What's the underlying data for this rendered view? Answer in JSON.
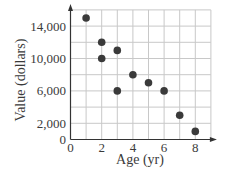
{
  "chart_data": {
    "type": "scatter",
    "title": "",
    "xlabel": "Age (yr)",
    "ylabel": "Value (dollars)",
    "x": [
      1,
      2,
      2,
      3,
      3,
      4,
      5,
      6,
      7,
      8
    ],
    "y": [
      15000,
      12000,
      10000,
      11000,
      6000,
      8000,
      7000,
      6000,
      3000,
      1000
    ],
    "points": [
      {
        "x": 1,
        "y": 15000
      },
      {
        "x": 2,
        "y": 12000
      },
      {
        "x": 2,
        "y": 10000
      },
      {
        "x": 3,
        "y": 11000
      },
      {
        "x": 3,
        "y": 6000
      },
      {
        "x": 4,
        "y": 8000
      },
      {
        "x": 5,
        "y": 7000
      },
      {
        "x": 6,
        "y": 6000
      },
      {
        "x": 7,
        "y": 3000
      },
      {
        "x": 8,
        "y": 1000
      }
    ],
    "xlim": [
      0,
      9
    ],
    "ylim": [
      0,
      16000
    ],
    "x_ticks": [
      0,
      2,
      4,
      6,
      8
    ],
    "x_tick_labels": [
      "0",
      "2",
      "4",
      "6",
      "8"
    ],
    "y_ticks": [
      0,
      2000,
      6000,
      10000,
      14000
    ],
    "y_tick_labels": [
      "0",
      "2,000",
      "6,000",
      "10,000",
      "14,000"
    ],
    "x_grid_step": 1,
    "y_grid_step": 2000,
    "grid": true,
    "legend": null,
    "colors": {
      "points": "#3a3a3a",
      "grid": "#c8c8c8",
      "axis": "#333333"
    }
  }
}
